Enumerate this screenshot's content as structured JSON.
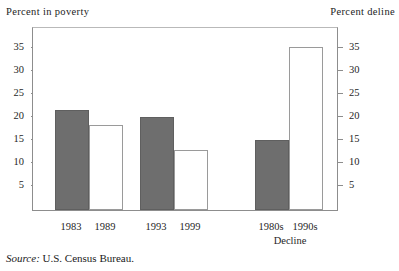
{
  "chart_data": {
    "type": "bar",
    "title": "",
    "categories": [
      "1983",
      "1989",
      "1993",
      "1999",
      "1980s",
      "1990s"
    ],
    "values": [
      21.0,
      17.8,
      19.6,
      12.3,
      14.5,
      34.7
    ],
    "series": [
      {
        "name": "Percent in poverty",
        "axis": "left",
        "points": [
          {
            "category": "1983",
            "value": 21.0,
            "style": "solid"
          },
          {
            "category": "1989",
            "value": 17.8,
            "style": "hollow"
          },
          {
            "category": "1993",
            "value": 19.6,
            "style": "solid"
          },
          {
            "category": "1999",
            "value": 12.3,
            "style": "hollow"
          }
        ]
      },
      {
        "name": "Percent decline",
        "axis": "right",
        "points": [
          {
            "category": "1980s",
            "value": 14.5,
            "style": "solid"
          },
          {
            "category": "1990s",
            "value": 34.7,
            "style": "hollow"
          }
        ]
      }
    ],
    "left_axis": {
      "label": "Percent in poverty",
      "ticks": [
        5,
        10,
        15,
        20,
        25,
        30,
        35
      ],
      "ylim": [
        0,
        38
      ]
    },
    "right_axis": {
      "label": "Percent deline",
      "ticks": [
        5,
        10,
        15,
        20,
        25,
        30,
        35
      ],
      "ylim": [
        0,
        38
      ]
    },
    "group_labels": [
      "Decline"
    ],
    "grid": false,
    "legend": "none",
    "xlabel": "",
    "ylabel": "Percent in poverty",
    "annotations": [
      "Source: U.S. Census Bureau."
    ]
  },
  "axes": {
    "left_caption": "Percent in poverty",
    "right_caption": "Percent deline",
    "tick_labels": [
      "35",
      "30",
      "25",
      "20",
      "15",
      "10",
      "5"
    ]
  },
  "bars": [
    {
      "label": "1983",
      "value": 21.0,
      "style": "solid"
    },
    {
      "label": "1989",
      "value": 17.8,
      "style": "hollow"
    },
    {
      "label": "1993",
      "value": 19.6,
      "style": "solid"
    },
    {
      "label": "1999",
      "value": 12.3,
      "style": "hollow"
    },
    {
      "label": "1980s",
      "value": 14.5,
      "style": "solid"
    },
    {
      "label": "1990s",
      "value": 34.7,
      "style": "hollow"
    }
  ],
  "group": {
    "decline_label": "Decline"
  },
  "source": {
    "prefix": "Source:",
    "text": "U.S. Census Bureau."
  },
  "colors": {
    "bar_solid_fill": "#6e6e6e",
    "bar_solid_stroke": "#5f5f5f",
    "bar_hollow_fill": "#ffffff",
    "bar_hollow_stroke": "#9a9a9a",
    "axis_line": "#8d8d8d",
    "text": "#1f1f1f",
    "background": "#ffffff"
  }
}
